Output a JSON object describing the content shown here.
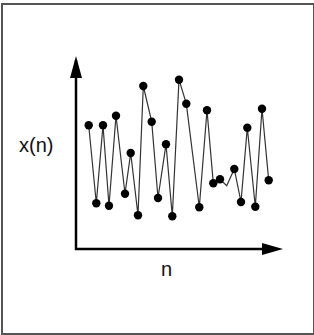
{
  "chart_data": {
    "type": "line",
    "title": "",
    "xlabel": "n",
    "ylabel": "x(n)",
    "grid": false,
    "legend": null,
    "ticks": {
      "x": [],
      "y": []
    },
    "note": "Discrete-time signal x(n) plotted as dots connected by line segments; axes have arrowheads and no tick labels. Values are relative (0 = horizontal axis, 100 = top of vertical arrow).",
    "x": [
      1,
      2,
      3,
      4,
      5,
      6,
      7,
      8,
      9,
      10,
      11,
      12,
      13,
      14,
      15,
      16,
      17,
      18,
      19,
      20,
      21,
      22,
      23,
      24,
      25
    ],
    "values": [
      65,
      24,
      65,
      23,
      70,
      29,
      50,
      18,
      85,
      67,
      27,
      55,
      17,
      89,
      76,
      22,
      73,
      34,
      36,
      42,
      25,
      64,
      22,
      74,
      36
    ],
    "series": [
      {
        "name": "x(n)",
        "marker": "filled-circle",
        "color": "#000000",
        "points_px": [
          [
            88.7,
            125.3
          ],
          [
            96.3,
            203.3
          ],
          [
            103,
            125.3
          ],
          [
            109,
            205.7
          ],
          [
            116,
            115.7
          ],
          [
            125,
            193.7
          ],
          [
            130.7,
            153
          ],
          [
            138,
            215.3
          ],
          [
            143.3,
            86
          ],
          [
            151.7,
            121.7
          ],
          [
            158,
            198
          ],
          [
            166,
            144.3
          ],
          [
            172.3,
            216.3
          ],
          [
            179,
            79.7
          ],
          [
            186.3,
            103.7
          ],
          [
            199.3,
            207.3
          ],
          [
            207,
            110.3
          ],
          [
            213.3,
            183.3
          ],
          [
            220,
            179.3
          ],
          [
            234.3,
            169
          ],
          [
            241,
            202
          ],
          [
            247.3,
            127.7
          ],
          [
            255.3,
            206.7
          ],
          [
            262,
            108.7
          ],
          [
            268.7,
            180.3
          ]
        ],
        "line_vertices_px": [
          [
            88.7,
            125.3
          ],
          [
            96.3,
            203.3
          ],
          [
            103,
            125.3
          ],
          [
            109,
            205.7
          ],
          [
            116,
            115.7
          ],
          [
            125,
            193.7
          ],
          [
            130.7,
            153
          ],
          [
            138,
            215.3
          ],
          [
            143.3,
            86
          ],
          [
            151.7,
            121.7
          ],
          [
            158,
            198
          ],
          [
            166,
            144.3
          ],
          [
            172.3,
            216.3
          ],
          [
            179,
            79.7
          ],
          [
            186.3,
            103.7
          ],
          [
            199.3,
            207.3
          ],
          [
            207,
            110.3
          ],
          [
            213.3,
            183.3
          ],
          [
            220,
            179.3
          ],
          [
            226.7,
            185.7
          ],
          [
            234.3,
            169
          ],
          [
            241,
            202
          ],
          [
            247.3,
            127.7
          ],
          [
            255.3,
            206.7
          ],
          [
            262,
            108.7
          ],
          [
            268.7,
            180.3
          ]
        ]
      }
    ],
    "axes": {
      "origin_px": [
        76,
        249
      ],
      "y_arrow_top_px": [
        76,
        58
      ],
      "x_arrow_right_px": [
        282,
        249
      ]
    },
    "colors": {
      "axis": "#000000",
      "line": "#333333",
      "marker": "#000000",
      "frame": "#555555"
    }
  }
}
